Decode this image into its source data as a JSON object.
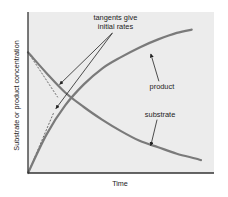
{
  "chart_data": {
    "type": "line",
    "title": "",
    "xlabel": "Time",
    "ylabel": "Substrate or product concentration",
    "xlim": [
      0,
      1
    ],
    "ylim": [
      0,
      1
    ],
    "grid": false,
    "ticks": "none",
    "colors": {
      "background": "#ececec",
      "curve": "#7a7a7a",
      "axis": "#333333",
      "annotation": "#222222"
    },
    "series": [
      {
        "name": "substrate",
        "x": [
          0,
          0.1,
          0.2,
          0.3,
          0.4,
          0.5,
          0.6,
          0.7,
          0.8,
          0.9,
          0.93
        ],
        "y": [
          0.75,
          0.62,
          0.5,
          0.41,
          0.33,
          0.26,
          0.2,
          0.16,
          0.12,
          0.09,
          0.08
        ]
      },
      {
        "name": "product",
        "x": [
          0,
          0.1,
          0.2,
          0.3,
          0.4,
          0.5,
          0.6,
          0.7,
          0.8,
          0.88
        ],
        "y": [
          0,
          0.24,
          0.42,
          0.55,
          0.65,
          0.72,
          0.78,
          0.83,
          0.87,
          0.89
        ]
      }
    ],
    "tangents": [
      {
        "name": "substrate-tangent",
        "x": [
          0,
          0.16
        ],
        "y": [
          0.75,
          0.47
        ]
      },
      {
        "name": "product-tangent",
        "x": [
          0,
          0.14
        ],
        "y": [
          0,
          0.38
        ]
      }
    ],
    "annotations": [
      {
        "text_lines": [
          "tangents give",
          "initial rates"
        ],
        "anchor": [
          0.47,
          0.95
        ],
        "arrows_to": [
          [
            0.17,
            0.55
          ],
          [
            0.15,
            0.4
          ]
        ]
      },
      {
        "text": "product",
        "anchor": [
          0.72,
          0.52
        ],
        "arrow_to": [
          0.66,
          0.74
        ]
      },
      {
        "text": "substrate",
        "anchor": [
          0.71,
          0.35
        ],
        "arrow_to": [
          0.66,
          0.17
        ]
      }
    ]
  }
}
